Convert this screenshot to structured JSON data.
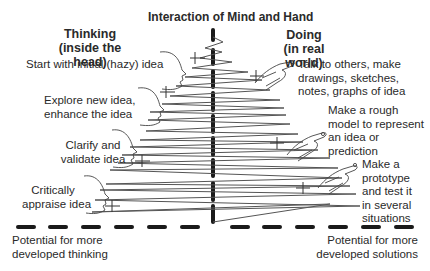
{
  "title": "Interaction of Mind and Hand",
  "left_column": {
    "heading_line1": "Thinking",
    "heading_line2": "(inside the head)",
    "steps": [
      {
        "lines": [
          "Start with initial (hazy) idea"
        ]
      },
      {
        "lines": [
          "Explore new idea,",
          "enhance the idea"
        ]
      },
      {
        "lines": [
          "Clarify and",
          "validate idea"
        ]
      },
      {
        "lines": [
          "Critically",
          "appraise idea"
        ]
      }
    ],
    "footer_line1": "Potential for more",
    "footer_line2": "developed thinking"
  },
  "right_column": {
    "heading_line1": "Doing",
    "heading_line2": "(in real world)",
    "steps": [
      {
        "lines": [
          "Talk to others, make",
          "drawings, sketches,",
          "notes, graphs of idea"
        ]
      },
      {
        "lines": [
          "Make a rough",
          "model to represent",
          "an idea or",
          "prediction"
        ]
      },
      {
        "lines": [
          "Make a",
          "prototype",
          "and test it",
          "in several",
          "situations"
        ]
      }
    ],
    "footer_line1": "Potential for more",
    "footer_line2": "developed solutions"
  },
  "icons": {
    "left": "head-profile-icon",
    "right": "hand-drawing-icon"
  },
  "colors": {
    "ink": "#2a2a2a",
    "line": "#555555",
    "axis": "#1a1a1a"
  }
}
